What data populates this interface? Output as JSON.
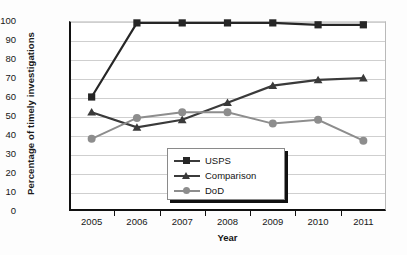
{
  "chart_data": {
    "type": "line",
    "title": "",
    "xlabel": "Year",
    "ylabel": "Percentage of timely investigations",
    "categories": [
      "2005",
      "2006",
      "2007",
      "2008",
      "2009",
      "2010",
      "2011"
    ],
    "x": [
      2005,
      2006,
      2007,
      2008,
      2009,
      2010,
      2011
    ],
    "xlim": [
      2005,
      2011
    ],
    "ylim": [
      0,
      100
    ],
    "yticks": [
      0,
      10,
      20,
      30,
      40,
      50,
      60,
      70,
      80,
      90,
      100
    ],
    "grid": true,
    "legend_position": "inside-bottom-center",
    "series": [
      {
        "name": "USPS",
        "marker": "square",
        "color": "#262626",
        "values": [
          60,
          99,
          99,
          99,
          99,
          98,
          98
        ]
      },
      {
        "name": "Comparison",
        "marker": "triangle",
        "color": "#3a3a3a",
        "values": [
          52,
          44,
          48,
          57,
          66,
          69,
          70
        ]
      },
      {
        "name": "DoD",
        "marker": "circle",
        "color": "#8d8d8d",
        "values": [
          38,
          49,
          52,
          52,
          46,
          48,
          37
        ]
      }
    ]
  },
  "legend": {
    "items": [
      {
        "label": "USPS",
        "marker": "square-marker-icon"
      },
      {
        "label": "Comparison",
        "marker": "triangle-marker-icon"
      },
      {
        "label": "DoD",
        "marker": "circle-marker-icon"
      }
    ]
  },
  "axes": {
    "y_title": "Percentage of timely investigations",
    "x_title": "Year",
    "y_tick_labels": [
      "100",
      "90",
      "80",
      "70",
      "60",
      "50",
      "40",
      "30",
      "20",
      "10",
      "0"
    ],
    "x_tick_labels": [
      "2005",
      "2006",
      "2007",
      "2008",
      "2009",
      "2010",
      "2011"
    ]
  },
  "colors": {
    "usps": "#262626",
    "comparison": "#3a3a3a",
    "dod": "#8d8d8d",
    "grid": "#cfcfcf",
    "axis": "#111111",
    "background": "#ffffff"
  }
}
